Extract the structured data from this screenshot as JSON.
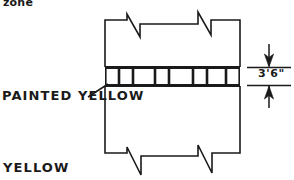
{
  "drawing": {
    "type": "engineering-cross-section",
    "title_fragment": "zone",
    "labels": {
      "zone": "zone",
      "painted_yellow": "PAINTED YELLOW",
      "yellow": "YELLOW",
      "dimension": "3'6\""
    },
    "colors": {
      "line": "#1a1a1a",
      "text": "#1a1a1a",
      "background": "#ffffff"
    },
    "roadway": {
      "left_edge_x": 105,
      "right_edge_x": 240,
      "top_y": 20,
      "bottom_y": 160,
      "break_symbols_top": 2,
      "break_symbols_bottom": 2
    },
    "painted_band": {
      "top_y": 67,
      "bottom_y": 85,
      "segment_count": 7,
      "description": "hatched painted median band"
    },
    "dimension_callout": {
      "value": "3'6\"",
      "extension_line_top_y": 67,
      "extension_line_bottom_y": 85,
      "arrow_top": "arrow-down",
      "arrow_bottom": "arrow-up"
    },
    "leader": {
      "from": "PAINTED YELLOW",
      "to": "painted band lower-left corner"
    }
  }
}
